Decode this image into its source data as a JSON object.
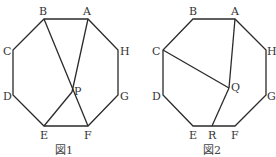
{
  "figures": [
    {
      "caption": "図1",
      "labels": {
        "A": "A",
        "B": "B",
        "C": "C",
        "D": "D",
        "E": "E",
        "F": "F",
        "G": "G",
        "H": "H",
        "P": "P"
      }
    },
    {
      "caption": "図2",
      "labels": {
        "A": "A",
        "B": "B",
        "C": "C",
        "D": "D",
        "E": "E",
        "F": "F",
        "G": "G",
        "H": "H",
        "Q": "Q",
        "R": "R"
      }
    }
  ]
}
